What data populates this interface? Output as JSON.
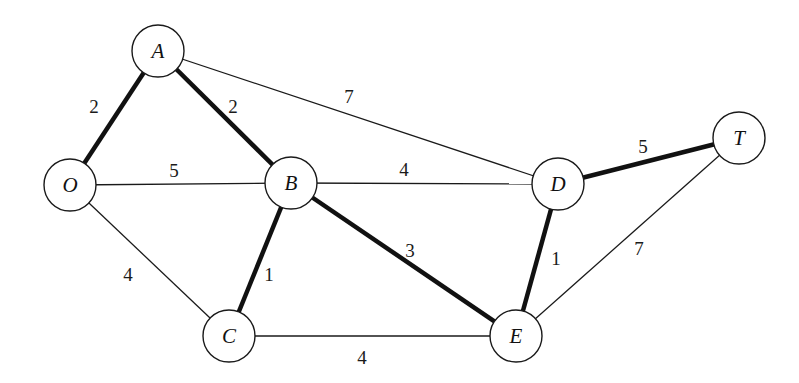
{
  "diagram": {
    "type": "weighted-undirected-graph",
    "node_radius": 26,
    "nodes": [
      {
        "id": "O",
        "label": "O",
        "x": 70,
        "y": 185
      },
      {
        "id": "A",
        "label": "A",
        "x": 158,
        "y": 51
      },
      {
        "id": "B",
        "label": "B",
        "x": 291,
        "y": 183
      },
      {
        "id": "C",
        "label": "C",
        "x": 229,
        "y": 336
      },
      {
        "id": "D",
        "label": "D",
        "x": 558,
        "y": 184
      },
      {
        "id": "E",
        "label": "E",
        "x": 516,
        "y": 336
      },
      {
        "id": "T",
        "label": "T",
        "x": 739,
        "y": 138
      }
    ],
    "edges": [
      {
        "from": "O",
        "to": "A",
        "weight": "2",
        "highlighted": true,
        "label_x": 94,
        "label_y": 106
      },
      {
        "from": "O",
        "to": "B",
        "weight": "5",
        "highlighted": false,
        "label_x": 174,
        "label_y": 170
      },
      {
        "from": "O",
        "to": "C",
        "weight": "4",
        "highlighted": false,
        "label_x": 128,
        "label_y": 274
      },
      {
        "from": "A",
        "to": "B",
        "weight": "2",
        "highlighted": true,
        "label_x": 233,
        "label_y": 106
      },
      {
        "from": "A",
        "to": "D",
        "weight": "7",
        "highlighted": false,
        "label_x": 349,
        "label_y": 96
      },
      {
        "from": "B",
        "to": "C",
        "weight": "1",
        "highlighted": true,
        "label_x": 269,
        "label_y": 274
      },
      {
        "from": "B",
        "to": "D",
        "weight": "4",
        "highlighted": false,
        "label_x": 404,
        "label_y": 169
      },
      {
        "from": "B",
        "to": "E",
        "weight": "3",
        "highlighted": true,
        "label_x": 410,
        "label_y": 250
      },
      {
        "from": "C",
        "to": "E",
        "weight": "4",
        "highlighted": false,
        "label_x": 362,
        "label_y": 357
      },
      {
        "from": "D",
        "to": "E",
        "weight": "1",
        "highlighted": true,
        "label_x": 556,
        "label_y": 258
      },
      {
        "from": "D",
        "to": "T",
        "weight": "5",
        "highlighted": true,
        "label_x": 643,
        "label_y": 146
      },
      {
        "from": "E",
        "to": "T",
        "weight": "7",
        "highlighted": false,
        "label_x": 639,
        "label_y": 248
      }
    ],
    "colors": {
      "background": "#ffffff",
      "stroke": "#1a1a1a",
      "highlight_stroke": "#111111"
    }
  }
}
